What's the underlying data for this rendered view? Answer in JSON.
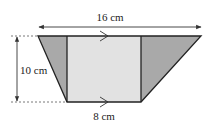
{
  "diagram": {
    "type": "trapezium",
    "labels": {
      "top_width": "16 cm",
      "height": "10 cm",
      "bottom_width": "8 cm"
    },
    "colors": {
      "background": "#ffffff",
      "outline": "#222222",
      "rectangle_fill": "#e2e2e2",
      "triangle_fill": "#a9a9a9",
      "dimension_line": "#333333",
      "dashed_line": "#555555"
    },
    "shape": {
      "top_left": [
        38,
        36
      ],
      "top_right": [
        201,
        36
      ],
      "bottom_right": [
        141,
        102
      ],
      "bottom_left": [
        67,
        102
      ],
      "inner_left_x": 67,
      "inner_right_x": 141
    },
    "parallel_markers": [
      "top",
      "bottom"
    ]
  }
}
